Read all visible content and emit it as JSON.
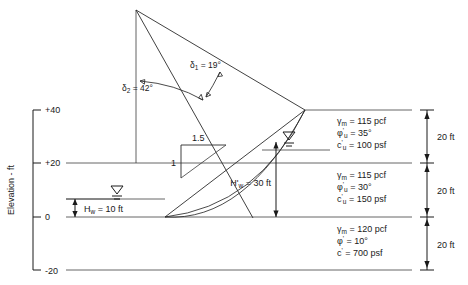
{
  "figure": {
    "axis": {
      "name": "Elevation - ft",
      "ticks": [
        {
          "label": "+40",
          "value": 40
        },
        {
          "label": "+20",
          "value": 20
        },
        {
          "label": "0",
          "value": 0
        },
        {
          "label": "-20",
          "value": -20
        }
      ]
    },
    "angles": [
      {
        "name": "delta-1",
        "label": "δ",
        "subscript": "1",
        "equals": " = 19°",
        "full": "δ1 = 19°"
      },
      {
        "name": "delta-2",
        "label": "δ",
        "subscript": "2",
        "equals": " = 42°",
        "full": "δ2 = 42°"
      }
    ],
    "slope_ratio": {
      "horizontal": "1.5",
      "vertical": "1"
    },
    "water": {
      "hw_label": "H",
      "hw_sub": "w",
      "hw_value": " = 10 ft",
      "hw_full": "Hw = 10 ft",
      "hwprime_label": "H'",
      "hwprime_sub": "w",
      "hwprime_value": " = 30 ft",
      "hwprime_full": "H'w = 30 ft"
    },
    "soil_layers": [
      {
        "name": "upper-layer",
        "unit_weight": {
          "symbol": "γ",
          "sub": "m",
          "text": " = 115 pcf"
        },
        "friction_angle": {
          "symbol": "φ",
          "sup": "'",
          "sub": "u",
          "text": " = 35°"
        },
        "cohesion": {
          "symbol": "c",
          "sup": "'",
          "sub": "u",
          "text": " = 100 psf"
        },
        "thickness": "20 ft"
      },
      {
        "name": "middle-layer",
        "unit_weight": {
          "symbol": "γ",
          "sub": "m",
          "text": " = 115 pcf"
        },
        "friction_angle": {
          "symbol": "φ",
          "sup": "'",
          "sub": "u",
          "text": " = 30°"
        },
        "cohesion": {
          "symbol": "c",
          "sup": "'",
          "sub": "u",
          "text": " = 150 psf"
        },
        "thickness": "20 ft"
      },
      {
        "name": "lower-layer",
        "unit_weight": {
          "symbol": "γ",
          "sub": "m",
          "text": " = 120 pcf"
        },
        "friction_angle": {
          "symbol": "φ",
          "sup": "'",
          "sub": "",
          "text": " = 10°"
        },
        "cohesion": {
          "symbol": "c",
          "sup": "'",
          "sub": "",
          "text": " = 700 psf"
        },
        "thickness": "20 ft"
      }
    ],
    "colors": {
      "line": "#2b2b2b",
      "layer_line": "#555555",
      "text": "#1a1a1a",
      "background": "#ffffff"
    }
  }
}
